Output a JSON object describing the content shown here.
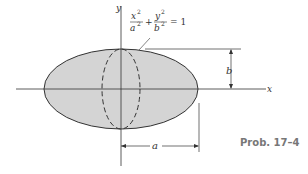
{
  "figure": {
    "caption": "Prob. 17–4",
    "equation": {
      "term1_num": "x",
      "term1_num_exp": "2",
      "term1_den": "a",
      "term1_den_exp": "2",
      "plus": "+",
      "term2_num": "y",
      "term2_num_exp": "2",
      "term2_den": "b",
      "term2_den_exp": "2",
      "equals": "= 1"
    },
    "axes": {
      "x_label": "x",
      "y_label": "y"
    },
    "dimensions": {
      "semi_major_label": "a",
      "semi_minor_label": "b"
    },
    "colors": {
      "fill": "#d4d4d4",
      "stroke": "#333333",
      "caption": "#777777"
    }
  }
}
